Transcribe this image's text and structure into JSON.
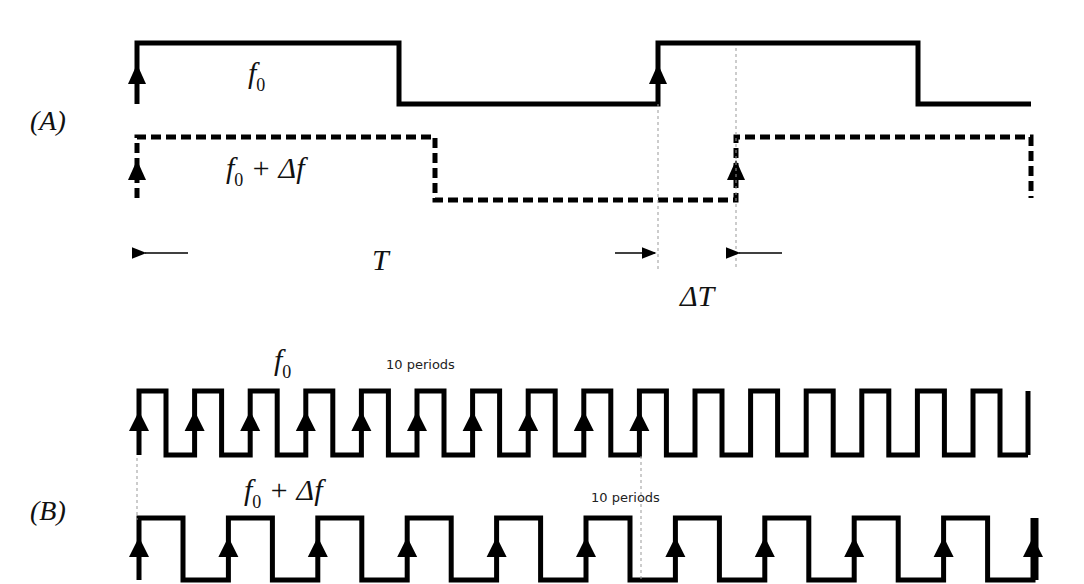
{
  "diagram": {
    "panel_a": {
      "label": "(A)",
      "signal_1": {
        "label": "f",
        "subscript": "0",
        "style": "solid"
      },
      "signal_2": {
        "label": "f",
        "subscript": "0",
        "suffix": " + Δf",
        "style": "dashed"
      },
      "period_label": "T",
      "offset_label": "ΔT"
    },
    "panel_b": {
      "label": "(B)",
      "signal_1": {
        "label": "f",
        "subscript": "0",
        "periods_note": "10 periods",
        "cycles_shown": 10
      },
      "signal_2": {
        "label": "f",
        "subscript": "0",
        "suffix": " + Δf",
        "periods_note": "10 periods",
        "cycles_shown": 6
      }
    },
    "colors": {
      "line": "#000000",
      "guide": "#999999",
      "background": "#ffffff"
    }
  }
}
